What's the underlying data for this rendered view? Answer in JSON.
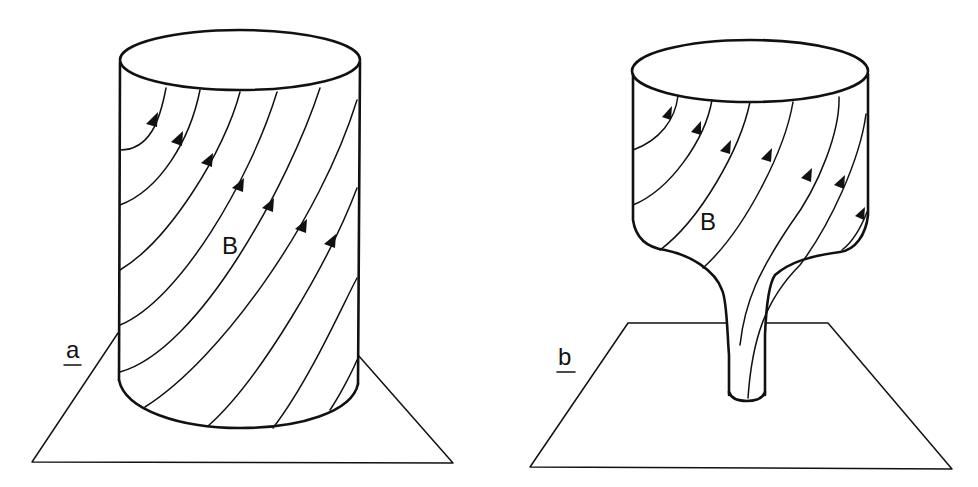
{
  "figure": {
    "panels": [
      {
        "id": "a",
        "label": "a",
        "field_label": "B",
        "description": "Straight cylinder of twisted magnetic field lines standing on a plane"
      },
      {
        "id": "b",
        "label": "b",
        "field_label": "B",
        "description": "Flux tube narrowing into a thin stem where it meets the plane"
      }
    ],
    "colors": {
      "ink": "#111111",
      "background": "#ffffff"
    }
  }
}
